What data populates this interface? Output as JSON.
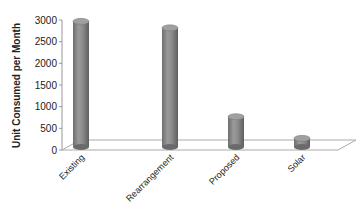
{
  "chart_data": {
    "type": "bar",
    "style": "3d-cylinder",
    "title": "",
    "xlabel": "",
    "ylabel": "Unit Consumed per Month",
    "categories": [
      "Existing",
      "Rearrangement",
      "Proposed",
      "Solar"
    ],
    "values": [
      2900,
      2750,
      700,
      200
    ],
    "ylim": [
      0,
      3000
    ],
    "yticks": [
      0,
      500,
      1000,
      1500,
      2000,
      2500,
      3000
    ],
    "grid": false,
    "legend": "none",
    "bar_color": "#8a8a8a"
  }
}
